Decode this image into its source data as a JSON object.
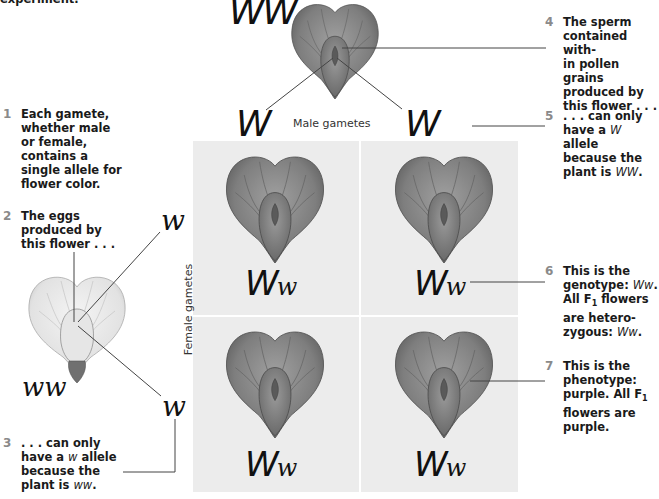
{
  "header_fragment": "experiment.",
  "parent_top": {
    "genotype": "WW",
    "flower_color": "purple"
  },
  "parent_left": {
    "genotype": "ww",
    "flower_color": "white"
  },
  "male_gametes": {
    "label": "Male gametes",
    "alleles": [
      "W",
      "W"
    ]
  },
  "female_gametes": {
    "label": "Female gametes",
    "alleles": [
      "w",
      "w"
    ]
  },
  "punnett": {
    "cells": [
      {
        "cap": "W",
        "low": "w",
        "flower_color": "purple"
      },
      {
        "cap": "W",
        "low": "w",
        "flower_color": "purple"
      },
      {
        "cap": "W",
        "low": "w",
        "flower_color": "purple"
      },
      {
        "cap": "W",
        "low": "w",
        "flower_color": "purple"
      }
    ]
  },
  "notes": [
    {
      "num": "1",
      "lines": [
        "Each gamete,",
        "whether male",
        "or female,",
        "contains a",
        "single allele for",
        "flower color."
      ]
    },
    {
      "num": "2",
      "lines": [
        "The eggs",
        "produced by",
        "this flower . . ."
      ]
    },
    {
      "num": "3",
      "lines_pre": [
        ". . . can only"
      ],
      "l2a": "have a ",
      "l2i": "w",
      "l2b": " allele",
      "l3": "because the",
      "l4a": "plant is ",
      "l4i": "ww",
      "l4b": "."
    },
    {
      "num": "4",
      "lines": [
        "The sperm",
        "contained with-",
        "in pollen grains",
        "produced by",
        "this flower . . ."
      ]
    },
    {
      "num": "5",
      "l1": ". . . can only",
      "l2a": "have a ",
      "l2i": "W",
      "l2b": " allele",
      "l3": "because the",
      "l4a": "plant is ",
      "l4i": "WW",
      "l4b": "."
    },
    {
      "num": "6",
      "l1": "This is the",
      "l2a": "genotype: ",
      "l2i": "Ww",
      "l2b": ".",
      "l3a": "All F",
      "l3sub": "1",
      "l3b": " flowers",
      "l4": "are hetero-",
      "l5a": "zygous: ",
      "l5i": "Ww",
      "l5b": "."
    },
    {
      "num": "7",
      "l1": "This is the",
      "l2": "phenotype:",
      "l3a": "purple. All F",
      "l3sub": "1",
      "l4": "flowers are",
      "l5": "purple."
    }
  ],
  "colors": {
    "grid_bg": "#e9e9e9",
    "number_gray": "#8a8a8a",
    "line": "#444444"
  }
}
